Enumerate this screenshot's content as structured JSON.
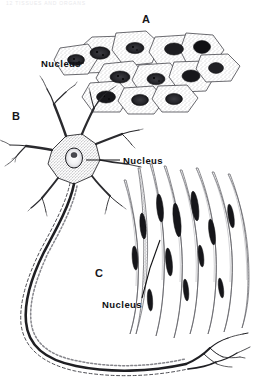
{
  "page": {
    "header_text": "12    TISSUES AND ORGANS",
    "background_color": "#ffffff",
    "ink_color": "#1a1a1d",
    "figure_title": "Three basic tissue types"
  },
  "panels": [
    {
      "letter": "A",
      "name": "squamous-epithelium",
      "description": "Flattened polygonal epithelial cells with stippled cytoplasm and dark oval nuclei",
      "nucleus_label": "Nucleus"
    },
    {
      "letter": "B",
      "name": "neuron",
      "description": "Multipolar nerve cell with branching dendrites, a stippled cell body containing a pale nucleus, and a long axon ending in terminal branches",
      "nucleus_label": "Nucleus"
    },
    {
      "letter": "C",
      "name": "smooth-muscle-fibers",
      "description": "Elongated spindle-shaped smooth muscle fibers each with a dark rod-shaped central nucleus",
      "nucleus_label": "Nucleus"
    }
  ],
  "labels": {
    "nucleus_a": "Nucleus",
    "nucleus_b": "Nucleus",
    "nucleus_c": "Nucleus",
    "letter_a": "A",
    "letter_b": "B",
    "letter_c": "C"
  },
  "colors": {
    "ink": "#1a1a1d",
    "mid_gray": "#6e6e73",
    "light_gray": "#b9b9be",
    "stipple": "#8a8a90",
    "nucleus_dark": "#2a2a2e",
    "paper": "#ffffff"
  }
}
